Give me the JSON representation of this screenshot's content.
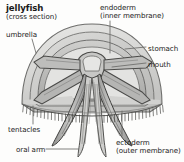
{
  "figure": {
    "title": "jellyfish",
    "subtitle": "(cross section)",
    "background_color": "#fdfdfc",
    "text_color": "#1a1a1a",
    "line_color": "#5a5a5a"
  },
  "labels": {
    "umbrella": "umbrella",
    "endoderm": "endoderm",
    "endoderm_sub": "(inner membrane)",
    "stomach": "stomach",
    "mouth": "mouth",
    "tentacles": "tentacles",
    "oral_arm": "oral arm",
    "ectoderm": "ectoderm",
    "ectoderm_sub": "(outer membrane)"
  }
}
